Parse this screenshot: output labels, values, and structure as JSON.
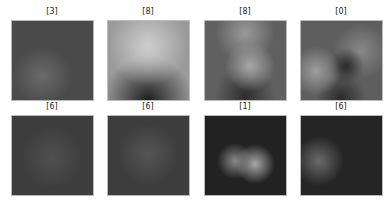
{
  "grid": {
    "rows": 2,
    "cols": 4,
    "items": [
      {
        "label": "[3]",
        "bg": "#4a4a4a",
        "blobs": [
          {
            "x": 30,
            "y": 55,
            "r": 30,
            "c": "#6a6a6a"
          }
        ]
      },
      {
        "label": "[8]",
        "bg": "#9a9a9a",
        "blobs": [
          {
            "x": 40,
            "y": 25,
            "r": 40,
            "c": "#cfcfcf"
          },
          {
            "x": 40,
            "y": 80,
            "r": 45,
            "c": "#1e1e1e"
          }
        ]
      },
      {
        "label": "[8]",
        "bg": "#606060",
        "blobs": [
          {
            "x": 40,
            "y": 12,
            "r": 30,
            "c": "#9a9a9a"
          },
          {
            "x": 45,
            "y": 45,
            "r": 25,
            "c": "#a8a8a8"
          },
          {
            "x": 40,
            "y": 75,
            "r": 30,
            "c": "#2e2e2e"
          }
        ]
      },
      {
        "label": "[0]",
        "bg": "#5e5e5e",
        "blobs": [
          {
            "x": 15,
            "y": 50,
            "r": 25,
            "c": "#9e9e9e"
          },
          {
            "x": 45,
            "y": 45,
            "r": 18,
            "c": "#2a2a2a"
          },
          {
            "x": 60,
            "y": 30,
            "r": 28,
            "c": "#888888"
          },
          {
            "x": 40,
            "y": 78,
            "r": 25,
            "c": "#2a2a2a"
          }
        ]
      },
      {
        "label": "[6]",
        "bg": "#3e3e3e",
        "blobs": [
          {
            "x": 40,
            "y": 42,
            "r": 30,
            "c": "#505050"
          }
        ]
      },
      {
        "label": "[6]",
        "bg": "#3e3e3e",
        "blobs": [
          {
            "x": 40,
            "y": 38,
            "r": 30,
            "c": "#555555"
          }
        ]
      },
      {
        "label": "[1]",
        "bg": "#222222",
        "blobs": [
          {
            "x": 30,
            "y": 45,
            "r": 18,
            "c": "#888888"
          },
          {
            "x": 50,
            "y": 48,
            "r": 20,
            "c": "#a8a8a8"
          }
        ]
      },
      {
        "label": "[6]",
        "bg": "#252525",
        "blobs": [
          {
            "x": 18,
            "y": 45,
            "r": 25,
            "c": "#6a6a6a"
          }
        ]
      }
    ]
  }
}
